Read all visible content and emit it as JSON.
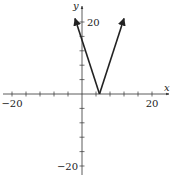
{
  "chart_data": {
    "type": "line",
    "title": "",
    "function": "y = 3|x - 5|",
    "xlabel": "x",
    "ylabel": "y",
    "xlim": [
      -20,
      20
    ],
    "ylim": [
      -20,
      20
    ],
    "x_tick_step": 4,
    "y_tick_step": 4,
    "x_tick_labels": [
      {
        "value": -20,
        "label": "−20"
      },
      {
        "value": 20,
        "label": "20"
      }
    ],
    "y_tick_labels": [
      {
        "value": 20,
        "label": "20"
      },
      {
        "value": -20,
        "label": "−20"
      }
    ],
    "grid": false,
    "series": [
      {
        "name": "absolute value graph",
        "points": [
          [
            -2,
            21
          ],
          [
            5,
            0
          ],
          [
            12,
            21
          ]
        ],
        "arrows_at_ends": true,
        "color": "#222222"
      }
    ]
  },
  "layout": {
    "origin_px": [
      82,
      94
    ],
    "px_per_unit_x": 3.5,
    "px_per_unit_y": 3.6
  }
}
